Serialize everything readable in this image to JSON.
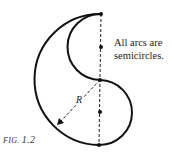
{
  "figure": {
    "caption_prefix": "FIG.",
    "caption_number": "1.2",
    "annotation_line1": "All arcs are",
    "annotation_line2": "semicircles.",
    "radius_label": "R"
  },
  "geometry": {
    "top_point": [
      101,
      14
    ],
    "middle_point": [
      100,
      80
    ],
    "bottom_point": [
      99,
      145
    ],
    "large_arc": {
      "center": [
        100,
        80
      ],
      "radius": 65,
      "side": "left"
    },
    "upper_small_arc": {
      "center": [
        101,
        47
      ],
      "radius": 33,
      "side": "left"
    },
    "lower_small_arc": {
      "center": [
        100,
        112
      ],
      "radius": 32,
      "side": "right"
    },
    "center_dots": [
      [
        101,
        47
      ],
      [
        100,
        112
      ]
    ],
    "colors": {
      "stroke": "#111111",
      "text": "#222222"
    }
  }
}
